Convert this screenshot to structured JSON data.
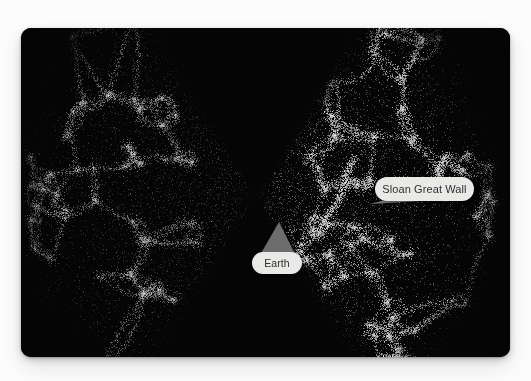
{
  "figure": {
    "kind": "cosmic-web-map",
    "title_visible": false,
    "background_color": "#fcfcfc",
    "panel_color": "#050505"
  },
  "panel": {
    "label": "sky-survey-panel"
  },
  "annotations": [
    {
      "id": "earth",
      "label": "Earth",
      "pill_color": "#e9e9e7",
      "text_color": "#2f2f2f",
      "pointer_color": "#6d6d6d",
      "pointer": "cone-up"
    },
    {
      "id": "sloan-great-wall",
      "label": "Sloan Great Wall",
      "pill_color": "#e9e9e7",
      "text_color": "#2f2f2f",
      "pointer_color": "#7a7a78",
      "pointer": "taper-down-left"
    }
  ],
  "chart_data": {
    "type": "scatter",
    "title": "",
    "subtitle": "",
    "xlabel": "",
    "ylabel": "",
    "grid": false,
    "legend": null,
    "annotations": [
      "Earth",
      "Sloan Great Wall"
    ],
    "observer": {
      "x": 256,
      "y": 197
    },
    "wedges": [
      {
        "name": "left-wedge",
        "direction_deg": 180,
        "half_opening_deg": 61,
        "radius_px": 250,
        "point_count": 9000,
        "brightness": 0.58,
        "mean_point_gray": "#8a8a8a"
      },
      {
        "name": "right-wedge",
        "direction_deg": 0,
        "half_opening_deg": 61,
        "radius_px": 250,
        "point_count": 12000,
        "brightness": 1.0,
        "mean_point_gray": "#cfcfcf"
      }
    ],
    "filament_seeds_left": 46,
    "filament_seeds_right": 60,
    "sloan_great_wall": {
      "anchor_x": 349,
      "anchor_y": 176,
      "brightness": 1.0
    }
  }
}
